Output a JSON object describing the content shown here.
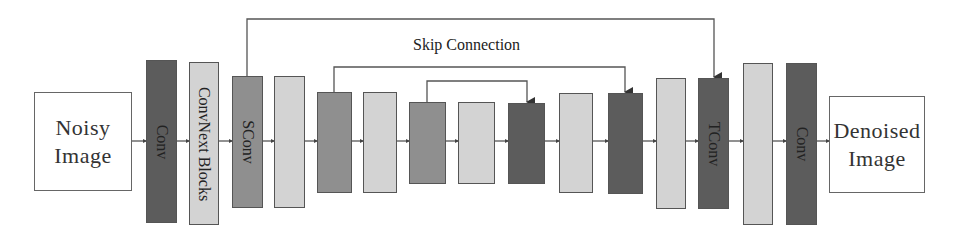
{
  "diagram": {
    "input_label_line1": "Noisy",
    "input_label_line2": "Image",
    "output_label_line1": "Denoised",
    "output_label_line2": "Image",
    "skip_label": "Skip Connection",
    "colors": {
      "dark": "#5c5c5c",
      "mid": "#8f8f8f",
      "light": "#d3d3d3",
      "io": "#ffffff",
      "line": "#555555"
    },
    "blocks": [
      {
        "id": "conv-in",
        "label": "Conv",
        "tone": "dark"
      },
      {
        "id": "convnext",
        "label": "ConvNext Blocks",
        "tone": "light"
      },
      {
        "id": "sconv",
        "label": "SConv",
        "tone": "mid"
      },
      {
        "id": "enc-light-1",
        "label": "",
        "tone": "light"
      },
      {
        "id": "enc-mid-2",
        "label": "",
        "tone": "mid"
      },
      {
        "id": "enc-light-2",
        "label": "",
        "tone": "light"
      },
      {
        "id": "enc-mid-3",
        "label": "",
        "tone": "mid"
      },
      {
        "id": "bottleneck-light",
        "label": "",
        "tone": "light"
      },
      {
        "id": "dec-dark-3",
        "label": "",
        "tone": "dark"
      },
      {
        "id": "dec-light-3",
        "label": "",
        "tone": "light"
      },
      {
        "id": "dec-dark-2",
        "label": "",
        "tone": "dark"
      },
      {
        "id": "dec-light-2",
        "label": "",
        "tone": "light"
      },
      {
        "id": "tconv",
        "label": "TConv",
        "tone": "dark"
      },
      {
        "id": "dec-light-1",
        "label": "",
        "tone": "light"
      },
      {
        "id": "conv-out",
        "label": "Conv",
        "tone": "dark"
      }
    ]
  }
}
